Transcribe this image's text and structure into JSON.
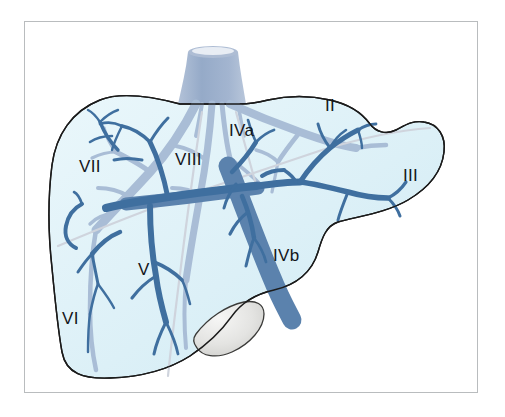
{
  "figure": {
    "kind": "anatomical-diagram",
    "frame_border_color": "#b9bcbe",
    "page_background": "#ffffff"
  },
  "palette": {
    "liver_parenchyma_fill": "#d9eef6",
    "liver_parenchyma_fill_light": "#eaf7fb",
    "liver_outline": "#1b1b1b",
    "portal_vein_dark": "#3f6f9f",
    "portal_vein_trunk": "#5b82ad",
    "hepatic_vein_light": "#a9bdd6",
    "vena_cava": "#9fb2cd",
    "bile_duct_pale": "#cfd4dd",
    "gallbladder_fill": "#e3e3e1",
    "gallbladder_outline": "#3a3a38",
    "label_text": "#141619"
  },
  "structures": [
    {
      "name": "inferior-vena-cava",
      "color": "#9fb2cd"
    },
    {
      "name": "hepatic-veins",
      "color": "#a9bdd6"
    },
    {
      "name": "portal-vein-trunk",
      "color": "#5b82ad"
    },
    {
      "name": "portal-vein-branches",
      "color": "#3f6f9f"
    },
    {
      "name": "bile-duct",
      "color": "#cfd4dd"
    },
    {
      "name": "gallbladder",
      "color": "#e3e3e1"
    },
    {
      "name": "liver-outline",
      "color": "#1b1b1b"
    }
  ],
  "segment_labels": [
    {
      "id": "II",
      "text": "II",
      "x": 325,
      "y": 97,
      "name": "segment-label-ii"
    },
    {
      "id": "III",
      "text": "III",
      "x": 403,
      "y": 167,
      "name": "segment-label-iii"
    },
    {
      "id": "IVa",
      "text": "IVa",
      "x": 229,
      "y": 122,
      "name": "segment-label-iva"
    },
    {
      "id": "IVb",
      "text": "IVb",
      "x": 273,
      "y": 247,
      "name": "segment-label-ivb"
    },
    {
      "id": "V",
      "text": "V",
      "x": 138,
      "y": 261,
      "name": "segment-label-v"
    },
    {
      "id": "VI",
      "text": "VI",
      "x": 62,
      "y": 310,
      "name": "segment-label-vi"
    },
    {
      "id": "VII",
      "text": "VII",
      "x": 79,
      "y": 158,
      "name": "segment-label-vii"
    },
    {
      "id": "VIII",
      "text": "VIII",
      "x": 175,
      "y": 151,
      "name": "segment-label-viii"
    }
  ]
}
